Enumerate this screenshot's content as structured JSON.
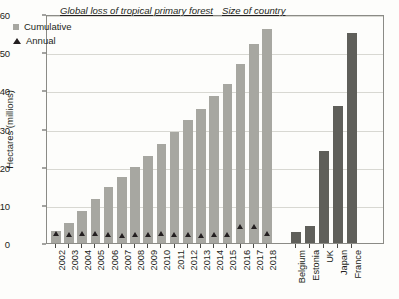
{
  "chart_data": {
    "type": "bar",
    "title": "Global loss of tropical primary forest",
    "secondary_title": "Size of country",
    "xlabel": "",
    "ylabel": "Hectares (millions)",
    "ylim": [
      0,
      60
    ],
    "yticks": [
      0,
      10,
      20,
      30,
      40,
      50,
      60
    ],
    "grid": true,
    "legend_position": "top-left",
    "legend": [
      {
        "label": "Cumulative",
        "marker": "square",
        "color": "#a7a7a1"
      },
      {
        "label": "Annual",
        "marker": "triangle",
        "color": "#231f20"
      }
    ],
    "categories": [
      "2002",
      "2003",
      "2004",
      "2005",
      "2006",
      "2007",
      "2008",
      "2009",
      "2010",
      "2011",
      "2012",
      "2013",
      "2014",
      "2015",
      "2016",
      "2017",
      "2018"
    ],
    "series": [
      {
        "name": "Cumulative",
        "values": [
          3.2,
          5.3,
          8.3,
          11.5,
          14.6,
          17.4,
          19.8,
          22.9,
          25.9,
          29.1,
          32.2,
          35.2,
          38.4,
          41.6,
          46.9,
          52.1,
          56.2
        ]
      },
      {
        "name": "Annual",
        "values": [
          3.2,
          2.9,
          3.2,
          3.1,
          2.9,
          2.6,
          2.8,
          3.0,
          3.2,
          2.9,
          2.9,
          2.5,
          3.0,
          2.8,
          5.0,
          4.9,
          3.1
        ]
      }
    ],
    "countries": {
      "label": "Size of country",
      "categories": [
        "Belgium",
        "Estonia",
        "UK",
        "Japan",
        "France"
      ],
      "values": [
        3.0,
        4.5,
        24.0,
        36.0,
        55.0
      ],
      "color": "#5f5f5a"
    }
  }
}
